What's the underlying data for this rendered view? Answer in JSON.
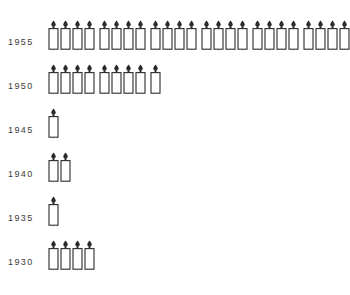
{
  "chart_data": {
    "type": "bar",
    "title": "",
    "subtitle": "",
    "xlabel": "",
    "ylabel": "",
    "grid": false,
    "legend": "none",
    "unit_icon": "candle-icon",
    "icons_per_group": 4,
    "categories": [
      "1955",
      "1950",
      "1945",
      "1940",
      "1935",
      "1930"
    ],
    "values": [
      24,
      9,
      1,
      2,
      1,
      4
    ],
    "series": [
      {
        "name": "",
        "values": [
          24,
          9,
          1,
          2,
          1,
          4
        ]
      }
    ],
    "rows": [
      {
        "label": "1955",
        "count": 24,
        "groups": [
          4,
          4,
          4,
          4,
          4,
          4
        ]
      },
      {
        "label": "1950",
        "count": 9,
        "groups": [
          4,
          4,
          1
        ]
      },
      {
        "label": "1945",
        "count": 1,
        "groups": [
          1
        ]
      },
      {
        "label": "1940",
        "count": 2,
        "groups": [
          2
        ]
      },
      {
        "label": "1935",
        "count": 1,
        "groups": [
          1
        ]
      },
      {
        "label": "1930",
        "count": 4,
        "groups": [
          4
        ]
      }
    ]
  },
  "colors": {
    "background": "#ffffff",
    "outline": "#2b2b2b",
    "flame": "#2b2b2b",
    "body_fill": "#ffffff",
    "label_text": "#3a3a3a"
  }
}
